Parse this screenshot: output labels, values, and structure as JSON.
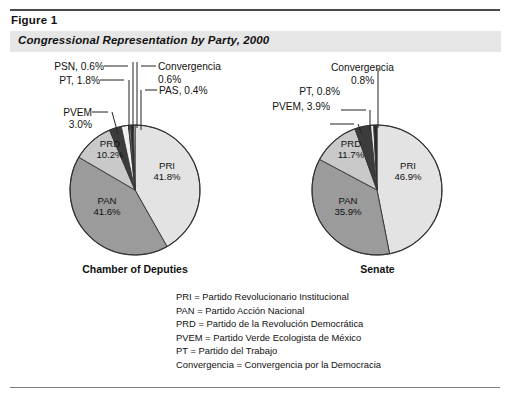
{
  "figure": {
    "label": "Figure 1",
    "title": "Congressional Representation by Party, 2000"
  },
  "chart_data": [
    {
      "type": "pie",
      "title": "Chamber of Deputies",
      "categories": [
        "PRI",
        "PAN",
        "PRD",
        "PVEM",
        "PT",
        "PSN",
        "Convergencia",
        "PAS"
      ],
      "values": [
        41.8,
        41.6,
        10.2,
        3.0,
        1.8,
        0.6,
        0.6,
        0.4
      ],
      "unit": "%",
      "colors": [
        "#e3e3e3",
        "#9b9b9b",
        "#c9c9c9",
        "#3c3c3c",
        "#efefef",
        "#6f6f6f",
        "#2a2a2a",
        "#d8d8d8"
      ],
      "inside_labels": [
        {
          "name": "PRI",
          "value": "41.8%"
        },
        {
          "name": "PAN",
          "value": "41.6%"
        },
        {
          "name": "PRD",
          "value": "10.2%"
        }
      ],
      "callout_labels": [
        {
          "text": "PSN, 0.6%"
        },
        {
          "text": "PT, 1.8%"
        },
        {
          "text": "PVEM"
        },
        {
          "text": "3.0%"
        },
        {
          "text": "Convergencia"
        },
        {
          "text": "0.6%"
        },
        {
          "text": "PAS, 0.4%"
        }
      ]
    },
    {
      "type": "pie",
      "title": "Senate",
      "categories": [
        "PRI",
        "PAN",
        "PRD",
        "PVEM",
        "PT",
        "Convergencia"
      ],
      "values": [
        46.9,
        35.9,
        11.7,
        3.9,
        0.8,
        0.8
      ],
      "unit": "%",
      "colors": [
        "#e3e3e3",
        "#9b9b9b",
        "#c9c9c9",
        "#3c3c3c",
        "#efefef",
        "#2a2a2a"
      ],
      "inside_labels": [
        {
          "name": "PRI",
          "value": "46.9%"
        },
        {
          "name": "PAN",
          "value": "35.9%"
        },
        {
          "name": "PRD",
          "value": "11.7%"
        }
      ],
      "callout_labels": [
        {
          "text": "Convergencia"
        },
        {
          "text": "0.8%"
        },
        {
          "text": "PT, 0.8%"
        },
        {
          "text": "PVEM, 3.9%"
        }
      ]
    }
  ],
  "legend": {
    "entries": [
      "PRI = Partido Revolucionario Institucional",
      "PAN = Partido Acción Nacional",
      "PRD = Partido de la Revolución Democrática",
      "PVEM = Partido Verde Ecologista de México",
      "PT = Partido del Trabajo",
      "Convergencia = Convergencia por la Democracia"
    ]
  }
}
